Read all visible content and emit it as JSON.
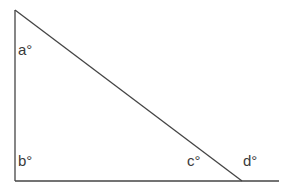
{
  "diagram": {
    "type": "triangle-with-extended-base",
    "line_color": "#444444",
    "label_color": "#3a3a3a",
    "labels": {
      "a": "a°",
      "b": "b°",
      "c": "c°",
      "d": "d°"
    }
  }
}
